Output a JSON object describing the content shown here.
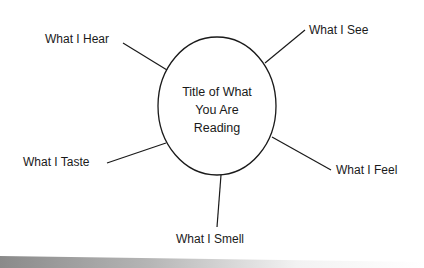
{
  "diagram": {
    "type": "web-organizer",
    "center": {
      "lines": [
        "Title of What",
        "You Are",
        "Reading"
      ]
    },
    "spokes": [
      {
        "label": "What I Hear"
      },
      {
        "label": "What I See"
      },
      {
        "label": "What I Taste"
      },
      {
        "label": "What I Feel"
      },
      {
        "label": "What I Smell"
      }
    ]
  }
}
